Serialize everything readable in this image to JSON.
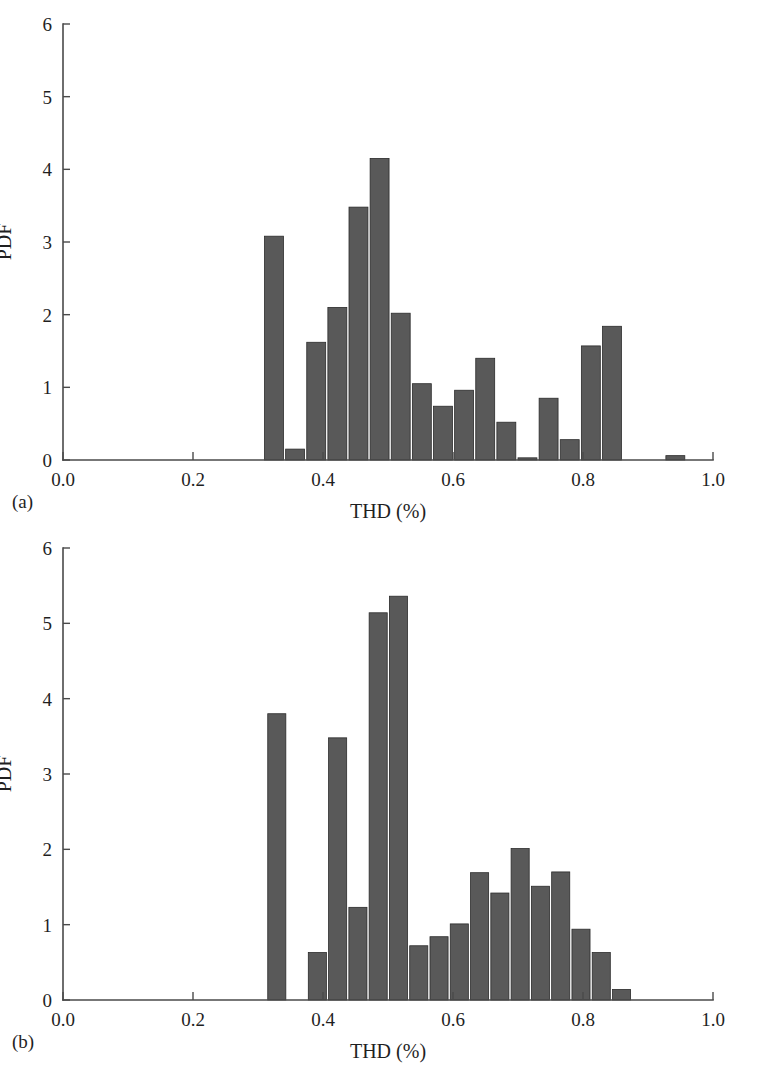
{
  "figure": {
    "background_color": "#ffffff",
    "bar_color": "#595959",
    "bar_edge_color": "#2b2b2b",
    "axis_color": "#4a4a4a"
  },
  "panels": [
    {
      "panel_label": "(a)",
      "xlabel": "THD (%)",
      "ylabel": "PDF",
      "x_ticks": [
        "0.0",
        "0.2",
        "0.4",
        "0.6",
        "0.8",
        "1.0"
      ],
      "y_ticks": [
        "0",
        "1",
        "2",
        "3",
        "4",
        "5",
        "6"
      ]
    },
    {
      "panel_label": "(b)",
      "xlabel": "THD (%)",
      "ylabel": "PDF",
      "x_ticks": [
        "0.0",
        "0.2",
        "0.4",
        "0.6",
        "0.8",
        "1.0"
      ],
      "y_ticks": [
        "0",
        "1",
        "2",
        "3",
        "4",
        "5",
        "6"
      ]
    }
  ],
  "chart_data": [
    {
      "type": "bar",
      "title": "(a)",
      "xlabel": "THD (%)",
      "ylabel": "PDF",
      "xlim": [
        0.0,
        1.0
      ],
      "ylim": [
        0,
        6
      ],
      "x_ticks": [
        0.0,
        0.2,
        0.4,
        0.6,
        0.8,
        1.0
      ],
      "y_ticks": [
        0,
        1,
        2,
        3,
        4,
        5,
        6
      ],
      "grid": false,
      "legend": "none",
      "bin_width": 0.0325,
      "bin_starts": [
        0.31,
        0.3425,
        0.375,
        0.4075,
        0.44,
        0.4725,
        0.505,
        0.5375,
        0.57,
        0.6025,
        0.635,
        0.6675,
        0.7,
        0.7325,
        0.765,
        0.7975,
        0.83,
        0.8625,
        0.895,
        0.9275
      ],
      "bin_centers": [
        0.3263,
        0.3588,
        0.3913,
        0.4238,
        0.4563,
        0.4888,
        0.5213,
        0.5538,
        0.5863,
        0.6188,
        0.6513,
        0.6838,
        0.7163,
        0.7488,
        0.7813,
        0.8138,
        0.8463,
        0.8788,
        0.9113,
        0.9438
      ],
      "values": [
        3.08,
        0.15,
        1.62,
        2.1,
        3.48,
        4.15,
        2.02,
        1.05,
        0.74,
        0.96,
        1.4,
        0.52,
        0.03,
        0.85,
        0.28,
        1.57,
        1.84,
        0.0,
        0.0,
        0.06
      ],
      "categories": [
        "0.33",
        "0.36",
        "0.39",
        "0.42",
        "0.46",
        "0.49",
        "0.52",
        "0.55",
        "0.59",
        "0.62",
        "0.65",
        "0.68",
        "0.72",
        "0.75",
        "0.78",
        "0.81",
        "0.85",
        "0.88",
        "0.91",
        "0.94"
      ]
    },
    {
      "type": "bar",
      "title": "(b)",
      "xlabel": "THD (%)",
      "ylabel": "PDF",
      "xlim": [
        0.0,
        1.0
      ],
      "ylim": [
        0,
        6
      ],
      "x_ticks": [
        0.0,
        0.2,
        0.4,
        0.6,
        0.8,
        1.0
      ],
      "y_ticks": [
        0,
        1,
        2,
        3,
        4,
        5,
        6
      ],
      "grid": false,
      "legend": "none",
      "bin_width": 0.0312,
      "bin_starts": [
        0.315,
        0.3774,
        0.4086,
        0.4398,
        0.471,
        0.5022,
        0.5334,
        0.5646,
        0.5958,
        0.627,
        0.6582,
        0.6894,
        0.7206,
        0.7518,
        0.783,
        0.8142,
        0.3462
      ],
      "bin_centers": [
        0.3306,
        0.393,
        0.4242,
        0.4554,
        0.4866,
        0.5178,
        0.549,
        0.5802,
        0.6114,
        0.6426,
        0.6738,
        0.705,
        0.7362,
        0.7674,
        0.7986,
        0.8298,
        0.3618
      ],
      "values": [
        3.8,
        0.63,
        3.48,
        1.23,
        5.14,
        5.36,
        0.72,
        0.84,
        1.01,
        1.69,
        1.42,
        2.01,
        1.51,
        1.7,
        0.94,
        0.63,
        0.14
      ],
      "ordered_bin_starts": [
        0.315,
        0.3774,
        0.4086,
        0.4398,
        0.471,
        0.5022,
        0.5334,
        0.5646,
        0.5958,
        0.627,
        0.6582,
        0.6894,
        0.7206,
        0.7518,
        0.783,
        0.8142,
        0.8454
      ],
      "ordered_values": [
        3.8,
        0.63,
        3.48,
        1.23,
        5.14,
        5.36,
        0.72,
        0.84,
        1.01,
        1.69,
        1.42,
        2.01,
        1.51,
        1.7,
        0.94,
        0.63,
        0.14
      ],
      "categories": [
        "0.33",
        "0.39",
        "0.42",
        "0.46",
        "0.49",
        "0.52",
        "0.55",
        "0.58",
        "0.61",
        "0.64",
        "0.67",
        "0.71",
        "0.74",
        "0.77",
        "0.80",
        "0.83",
        "0.86"
      ]
    }
  ]
}
